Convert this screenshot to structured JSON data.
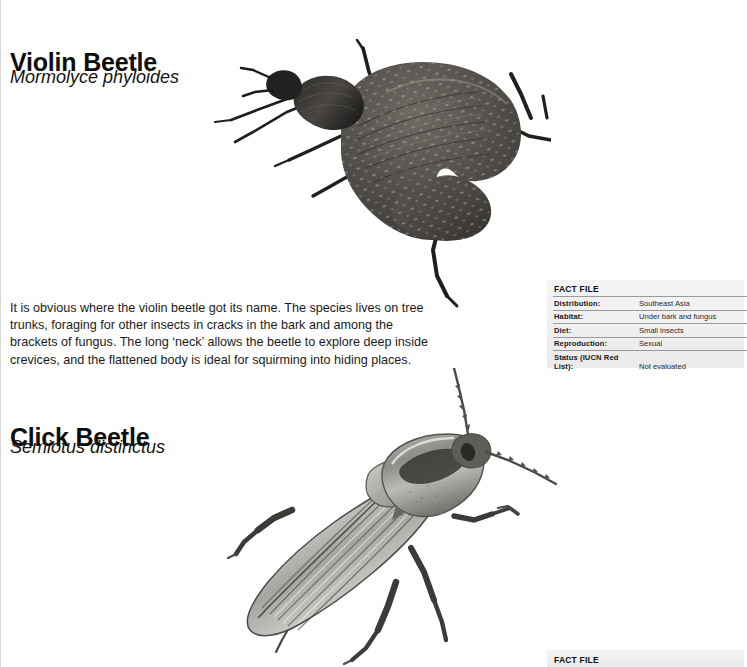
{
  "page": {
    "background": "#ffffff",
    "panel_background": "#efefef"
  },
  "entries": [
    {
      "title": "Violin Beetle",
      "scientific_name": "Mormolyce phyloides",
      "body": "It is obvious where the violin beetle got its name. The species lives on tree trunks, foraging for other insects in cracks in the bark and among the brackets of fungus. The long ‘neck’ allows the beetle to explore deep inside crevices, and the flattened body is ideal for squirming into hiding places.",
      "illustration": "violin-beetle-illustration",
      "factfile": {
        "heading": "FACT FILE",
        "rows": [
          {
            "label": "Distribution:",
            "value": "Southeast Asia"
          },
          {
            "label": "Habitat:",
            "value": "Under bark and fungus"
          },
          {
            "label": "Diet:",
            "value": "Small insects"
          },
          {
            "label": "Reproduction:",
            "value": "Sexual"
          },
          {
            "label": "Status (IUCN Red List):",
            "value": "Not evaluated"
          }
        ]
      }
    },
    {
      "title": "Click Beetle",
      "scientific_name": "Semiotus distinctus",
      "illustration": "click-beetle-illustration",
      "factfile": {
        "heading": "FACT FILE",
        "rows": []
      }
    }
  ]
}
